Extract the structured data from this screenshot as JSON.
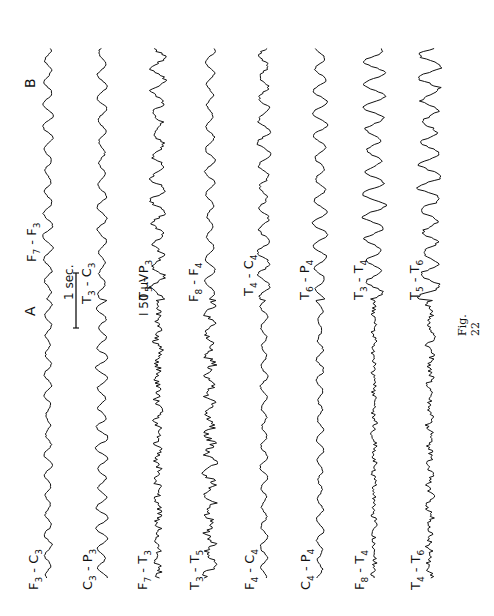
{
  "figure": {
    "caption": "Fig. 22",
    "orientation": "rotated 90° counter-clockwise",
    "panels": [
      "A",
      "B"
    ],
    "scale_bars": {
      "time": "1 sec.",
      "amplitude": "I 50 µV"
    },
    "ink_color": "#111111",
    "background": "#ffffff"
  },
  "panel_a": {
    "label": "A",
    "channels": [
      {
        "base": "F",
        "a": "3",
        "sep": " - ",
        "b2": "C",
        "b": "3"
      },
      {
        "base": "C",
        "a": "3",
        "sep": " - ",
        "b2": "P",
        "b": "3"
      },
      {
        "base": "F",
        "a": "7",
        "sep": " - ",
        "b2": "T",
        "b": "3"
      },
      {
        "base": "T",
        "a": "3",
        "sep": " - ",
        "b2": "T",
        "b": "5"
      },
      {
        "base": "F",
        "a": "4",
        "sep": " - ",
        "b2": "C",
        "b": "4"
      },
      {
        "base": "C",
        "a": "4",
        "sep": " - ",
        "b2": "P",
        "b": "4"
      },
      {
        "base": "F",
        "a": "8",
        "sep": " - ",
        "b2": "T",
        "b": "4"
      },
      {
        "base": "T",
        "a": "4",
        "sep": " - ",
        "b2": "T",
        "b": "6"
      }
    ]
  },
  "panel_b": {
    "label": "B",
    "channels": [
      {
        "base": "F",
        "a": "7",
        "sep": " - ",
        "b2": "F",
        "b": "3"
      },
      {
        "base": "T",
        "a": "3",
        "sep": " - ",
        "b2": "C",
        "b": "3"
      },
      {
        "base": "T",
        "a": "5",
        "sep": " - ",
        "b2": "P",
        "b": "3"
      },
      {
        "base": "F",
        "a": "8",
        "sep": " - ",
        "b2": "F",
        "b": "4"
      },
      {
        "base": "T",
        "a": "4",
        "sep": " - ",
        "b2": "C",
        "b": "4"
      },
      {
        "base": "T",
        "a": "6",
        "sep": " - ",
        "b2": "P",
        "b": "4"
      },
      {
        "base": "T",
        "a": "3",
        "sep": " - ",
        "b2": "T",
        "b": "4"
      },
      {
        "base": "T",
        "a": "5",
        "sep": " - ",
        "b2": "T",
        "b": "6"
      }
    ]
  }
}
